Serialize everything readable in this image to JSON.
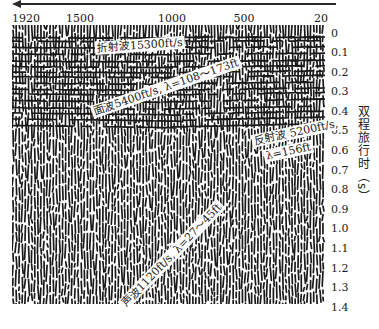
{
  "figure": {
    "type": "seismic shot record",
    "direction_arrow": "arrow-left",
    "x_axis": {
      "ticks": [
        "1920",
        "1500",
        "1000",
        "500",
        "20"
      ]
    },
    "y_axis": {
      "label": "双程旅行时（s）",
      "ticks": [
        "0",
        "0.1",
        "0.2",
        "0.3",
        "0.4",
        "0.5",
        "0.6",
        "0.7",
        "0.8",
        "0.9",
        "1.0",
        "1.1",
        "1.2",
        "1.3",
        "1.4"
      ]
    },
    "annotations": {
      "refraction": "折射波15300ft/s",
      "surface_wave": "面波5400ft/s, λ=108～173ft",
      "reflection_line1": "反射波 5200ft/s,",
      "reflection_line2": "λ=156ft",
      "acoustic_wave": "声波1120ft/s, λ=27～45ft"
    },
    "colors": {
      "ink": "#1a1a1a",
      "background": "#ffffff"
    }
  }
}
